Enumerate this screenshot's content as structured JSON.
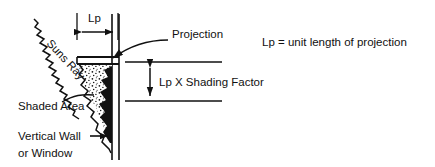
{
  "figure": {
    "title_text": "",
    "background_color": "#ffffff",
    "ink_color": "#111111",
    "width": 435,
    "height": 167
  },
  "labels": {
    "lp_dimension": "Lp",
    "projection": "Projection",
    "lp_shading_factor": "Lp X Shading Factor",
    "legend_note": "Lp = unit length of projection",
    "suns_ray": "Suns Ray",
    "shaded_area": "Shaded Area",
    "vertical_wall_line1": "Vertical Wall",
    "vertical_wall_line2": "or Window"
  },
  "icons": {
    "sun_ray_zigzag": "zigzag-ray-icon",
    "arrow_left": "arrow-left-icon",
    "arrow_right": "arrow-right-icon",
    "arrow_up": "arrow-up-icon",
    "arrow_down": "arrow-down-icon",
    "leader_arrow_projection": "leader-arrow-icon",
    "leader_arrow_wall": "leader-arrow-icon",
    "stipple_texture": "stipple-shading-icon"
  },
  "geometry": {
    "wall_x_outer": 112,
    "wall_x_inner": 119,
    "wall_top_y": 14,
    "wall_bottom_y": 160,
    "projection_left_x": 77,
    "projection_right_x": 118,
    "projection_top_y": 57,
    "projection_bottom_y": 64,
    "horizontal_dim_y": 32,
    "vertical_dim_x": 150,
    "vertical_dim_top_y": 62,
    "vertical_dim_bottom_y": 101
  }
}
